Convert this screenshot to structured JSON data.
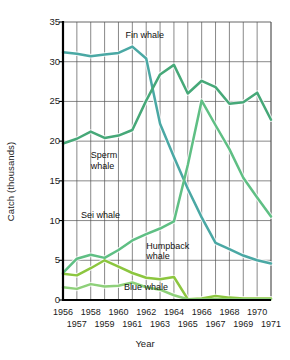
{
  "chart_data": {
    "type": "line",
    "title": "",
    "xlabel": "Year",
    "ylabel": "Catch (thousands)",
    "xlim": [
      1956,
      1971
    ],
    "ylim": [
      0,
      35
    ],
    "yticks": [
      0,
      5,
      10,
      15,
      20,
      25,
      30,
      35
    ],
    "grid": true,
    "legend_position": "inline-annotations",
    "x": [
      1956,
      1957,
      1958,
      1959,
      1960,
      1961,
      1962,
      1963,
      1964,
      1965,
      1966,
      1967,
      1968,
      1969,
      1970,
      1971
    ],
    "categories_row1": [
      "1956",
      "",
      "1958",
      "",
      "1960",
      "",
      "1962",
      "",
      "1964",
      "",
      "1966",
      "",
      "1968",
      "",
      "1970",
      ""
    ],
    "categories_row2": [
      "",
      "1957",
      "",
      "1959",
      "",
      "1961",
      "",
      "1963",
      "",
      "1965",
      "",
      "1967",
      "",
      "1969",
      "",
      "1971"
    ],
    "series": [
      {
        "name": "Fin whale",
        "color": "#4aa8a4",
        "values": [
          31.2,
          31.0,
          30.7,
          30.9,
          31.1,
          31.9,
          30.4,
          22.2,
          18.0,
          14.0,
          10.4,
          7.2,
          6.4,
          5.6,
          5.0,
          4.6
        ]
      },
      {
        "name": "Sperm whale",
        "color": "#46a878",
        "values": [
          19.7,
          20.3,
          21.2,
          20.4,
          20.7,
          21.4,
          25.1,
          28.4,
          29.6,
          26.0,
          27.6,
          26.8,
          24.7,
          24.9,
          26.1,
          22.7
        ]
      },
      {
        "name": "Sei whale",
        "color": "#5fbf84",
        "values": [
          3.4,
          5.2,
          5.7,
          5.3,
          6.3,
          7.5,
          8.3,
          9.0,
          9.9,
          17.0,
          25.1,
          22.0,
          19.0,
          15.4,
          12.9,
          10.5
        ]
      },
      {
        "name": "Humpback whale",
        "color": "#8cc63f",
        "values": [
          3.3,
          3.1,
          4.0,
          5.0,
          4.2,
          3.4,
          2.8,
          2.6,
          2.9,
          0.1,
          0.2,
          0.5,
          0.3,
          0.2,
          0.2,
          0.2
        ]
      },
      {
        "name": "Blue whale",
        "color": "#8ed07a",
        "values": [
          1.6,
          1.4,
          2.0,
          1.7,
          1.8,
          2.2,
          1.6,
          1.3,
          0.6,
          0.1,
          0.1,
          0.1,
          0.1,
          0.1,
          0.1,
          0.1
        ]
      }
    ],
    "annotations": [
      {
        "text": "Fin whale",
        "x": 1960.5,
        "y": 33.3
      },
      {
        "text": "Sperm\nwhale",
        "x": 1958.0,
        "y": 18.1
      },
      {
        "text": "Sei whale",
        "x": 1957.3,
        "y": 10.6
      },
      {
        "text": "Humpback\nwhale",
        "x": 1962.0,
        "y": 6.7
      },
      {
        "text": "Blue whale",
        "x": 1960.4,
        "y": 1.5
      }
    ]
  },
  "axis": {
    "ylabel": "Catch (thousands)",
    "xlabel": "Year"
  }
}
